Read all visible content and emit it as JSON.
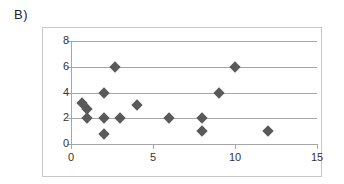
{
  "panel": {
    "label": "B)"
  },
  "chart_data": {
    "type": "scatter",
    "title": "",
    "xlabel": "",
    "ylabel": "",
    "xlim": [
      0,
      15
    ],
    "ylim": [
      0,
      8
    ],
    "xticks": [
      0,
      5,
      10,
      15
    ],
    "yticks": [
      0,
      2,
      4,
      6,
      8
    ],
    "xtick_labels": [
      "0",
      "5",
      "10",
      "15"
    ],
    "ytick_labels": [
      "0",
      "2",
      "4",
      "6",
      "8"
    ],
    "grid": "horizontal",
    "legend": "none",
    "marker": "diamond",
    "marker_color": "#595959",
    "axis_color": "#a6a6a6",
    "frame_color": "#c8c8c8",
    "points": [
      {
        "x": 0.7,
        "y": 3.2
      },
      {
        "x": 1.0,
        "y": 2.7
      },
      {
        "x": 1.0,
        "y": 2.0
      },
      {
        "x": 2.0,
        "y": 4.0
      },
      {
        "x": 2.0,
        "y": 2.0
      },
      {
        "x": 2.0,
        "y": 0.8
      },
      {
        "x": 2.7,
        "y": 6.0
      },
      {
        "x": 3.0,
        "y": 2.0
      },
      {
        "x": 4.0,
        "y": 3.0
      },
      {
        "x": 6.0,
        "y": 2.0
      },
      {
        "x": 8.0,
        "y": 2.0
      },
      {
        "x": 8.0,
        "y": 1.0
      },
      {
        "x": 9.0,
        "y": 4.0
      },
      {
        "x": 10.0,
        "y": 6.0
      },
      {
        "x": 12.0,
        "y": 1.0
      }
    ]
  }
}
